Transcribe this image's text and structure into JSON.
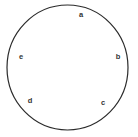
{
  "figure": {
    "type": "circle-with-labeled-points",
    "background_color": "#ffffff",
    "width": 138,
    "height": 137
  },
  "circle": {
    "name": "circle-outline",
    "stroke_color": "#2b2b2b",
    "fill_color": "#ffffff",
    "stroke_width": 1.2,
    "center_x": 67.5,
    "center_y": 67.5,
    "radius_x": 60.5,
    "radius_y": 62.5
  },
  "labels": [
    {
      "text": "a",
      "x": 81,
      "y": 15,
      "name": "point-label-a"
    },
    {
      "text": "b",
      "x": 118,
      "y": 57,
      "name": "point-label-b"
    },
    {
      "text": "c",
      "x": 103,
      "y": 103,
      "name": "point-label-c"
    },
    {
      "text": "d",
      "x": 30,
      "y": 101,
      "name": "point-label-d"
    },
    {
      "text": "e",
      "x": 21,
      "y": 57,
      "name": "point-label-e"
    }
  ],
  "label_style": {
    "color": "#333333",
    "font_size_px": 7.5,
    "font_weight": "bold"
  }
}
